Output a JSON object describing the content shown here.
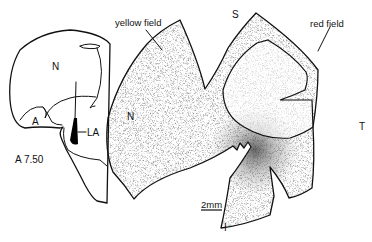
{
  "figure": {
    "section_drawing": {
      "labels": {
        "nucleus": "N",
        "area": "A",
        "lesion": "LA",
        "coordinate": "A 7.50"
      }
    },
    "retina_map": {
      "labels": {
        "yellow_field": "yellow field",
        "red_field": "red field",
        "superior": "S",
        "nasal": "N",
        "temporal": "T",
        "inferior": "I"
      },
      "scale_bar": "2mm"
    }
  }
}
